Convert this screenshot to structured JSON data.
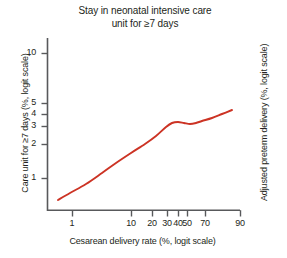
{
  "chart_data": {
    "type": "line",
    "title": "Stay in neonatal intensive care unit for ≥7 days",
    "title_lines": [
      "Stay in neonatal intensive care",
      "unit for ≥7 days"
    ],
    "xlabel": "Cesarean delivery rate (%, logit scale)",
    "ylabel": "Care unit for ≥7 days (%, logit scale)",
    "ylabel_right": "Adjusted preterm delivery (%, logit scale)",
    "xscale": "logit",
    "yscale": "logit",
    "grid": false,
    "legend": null,
    "line_color": "#cc3324",
    "axis_color": "#58595b",
    "xticks": [
      1,
      10,
      20,
      30,
      40,
      50,
      70,
      90
    ],
    "xtick_labels": [
      "1",
      "10",
      "20",
      "30",
      "40",
      "50",
      "70",
      "90"
    ],
    "xtick_px": [
      72,
      131,
      152,
      167,
      178,
      187,
      205,
      240
    ],
    "yticks": [
      10,
      5,
      4,
      3,
      2,
      1
    ],
    "ytick_labels": [
      "10",
      "5",
      "4",
      "3",
      "2",
      "1"
    ],
    "ytick_px": [
      53,
      103,
      114,
      126,
      144,
      178
    ],
    "xlim": [
      0.55,
      92
    ],
    "ylim": [
      0.38,
      14
    ],
    "series": [
      {
        "name": "Adjusted preterm delivery",
        "x": [
          0.8,
          1.5,
          3,
          6,
          10,
          15,
          20,
          25,
          30,
          33,
          36,
          40,
          45,
          50,
          55,
          62,
          70,
          80
        ],
        "y": [
          0.48,
          0.58,
          0.72,
          0.95,
          1.2,
          1.5,
          1.85,
          2.25,
          2.75,
          2.95,
          2.95,
          2.9,
          2.9,
          2.95,
          3.05,
          3.25,
          3.5,
          3.8
        ],
        "points_px": [
          [
            58,
            200
          ],
          [
            70,
            193
          ],
          [
            86,
            184
          ],
          [
            102,
            173
          ],
          [
            116,
            163
          ],
          [
            131,
            153
          ],
          [
            145,
            144
          ],
          [
            156,
            136
          ],
          [
            166,
            127
          ],
          [
            172,
            123
          ],
          [
            178,
            122
          ],
          [
            184,
            123
          ],
          [
            190,
            124
          ],
          [
            196,
            123
          ],
          [
            202,
            121
          ],
          [
            212,
            118
          ],
          [
            222,
            114
          ],
          [
            232,
            110
          ]
        ]
      }
    ]
  },
  "figure": {
    "width": 287,
    "height": 258,
    "background": "#ffffff"
  }
}
